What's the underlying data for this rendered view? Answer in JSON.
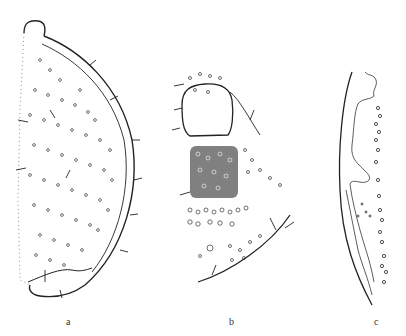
{
  "figure": {
    "panels": [
      {
        "id": "a",
        "label": "a",
        "description": "semi-circular body section with dense pore dots and setae"
      },
      {
        "id": "b",
        "label": "b",
        "description": "partial section with rounded plate, dense stippled region and setae"
      },
      {
        "id": "c",
        "label": "c",
        "description": "narrow marginal section with wavy inner membrane and pore row"
      }
    ],
    "colors": {
      "ink": "#222222",
      "background": "#ffffff"
    }
  }
}
